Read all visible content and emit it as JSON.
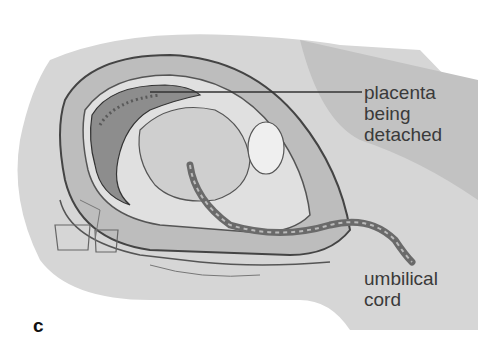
{
  "figure": {
    "panel_letter": "c",
    "labels": [
      {
        "id": "placenta",
        "lines": [
          "placenta",
          "being",
          "detached"
        ]
      },
      {
        "id": "cord",
        "lines": [
          "umbilical",
          "cord"
        ]
      }
    ],
    "colors": {
      "ink": "#3a3a3a",
      "tissue": "#a8a8a8",
      "shadow": "#6e6e6e",
      "light": "#d8d8d8"
    }
  }
}
